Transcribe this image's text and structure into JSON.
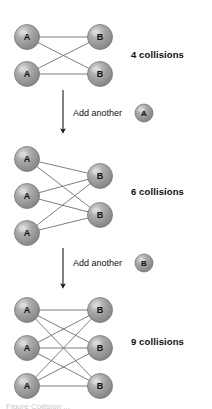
{
  "figure": {
    "type": "diagram",
    "title_visible": false,
    "background_color": "#ffffff",
    "node_fill_color": "#9a9a9a",
    "node_highlight_color": "#cfcfcf",
    "node_edge_color": "#6b6b6b",
    "edge_color": "#6f6f6f",
    "text_color": "#101010",
    "caption_partial": "Figure  Collision ...",
    "stages": [
      {
        "id": "stage-1",
        "left_nodes": [
          "A",
          "A"
        ],
        "right_nodes": [
          "B",
          "B"
        ],
        "edge_count": 4,
        "label": "4 collisions",
        "label_x": 131,
        "label_y": 54,
        "left_x": 27,
        "right_x": 100,
        "left_ys": [
          37,
          74
        ],
        "right_ys": [
          37,
          74
        ],
        "radius": 12.5
      },
      {
        "id": "stage-2",
        "left_nodes": [
          "A",
          "A",
          "A"
        ],
        "right_nodes": [
          "B",
          "B"
        ],
        "edge_count": 6,
        "label": "6 collisions",
        "label_x": 131,
        "label_y": 191,
        "left_x": 27,
        "right_x": 100,
        "left_ys": [
          159,
          196,
          233
        ],
        "right_ys": [
          176,
          215
        ],
        "radius": 12.5
      },
      {
        "id": "stage-3",
        "left_nodes": [
          "A",
          "A",
          "A"
        ],
        "right_nodes": [
          "B",
          "B",
          "B"
        ],
        "edge_count": 9,
        "label": "9 collisions",
        "label_x": 131,
        "label_y": 341,
        "left_x": 27,
        "right_x": 100,
        "left_ys": [
          310,
          348,
          386
        ],
        "right_ys": [
          310,
          348,
          386
        ],
        "radius": 12.5
      }
    ],
    "transitions": [
      {
        "id": "transition-1",
        "text": "Add another",
        "text_x": 73,
        "text_y": 109,
        "node_letter": "A",
        "node_cx": 144,
        "node_cy": 113,
        "node_r": 9,
        "arrow_x": 63,
        "arrow_y_start": 90,
        "arrow_y_end": 136
      },
      {
        "id": "transition-2",
        "text": "Add another",
        "text_x": 73,
        "text_y": 259,
        "node_letter": "B",
        "node_cx": 144,
        "node_cy": 263,
        "node_r": 9,
        "arrow_x": 63,
        "arrow_y_start": 248,
        "arrow_y_end": 291
      }
    ]
  }
}
